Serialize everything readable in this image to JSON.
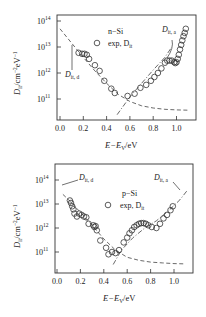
{
  "chart_data": [
    {
      "type": "scatter",
      "title": "n-Si",
      "xlabel": "E−E_V/eV",
      "ylabel": "D_it/cm^-2eV^-1",
      "xlim": [
        -0.02,
        1.12
      ],
      "ylim_log10": [
        10.5,
        14.2
      ],
      "yscale": "log",
      "xticks": [
        "0.0",
        "0.2",
        "0.4",
        "0.6",
        "0.8",
        "1.0"
      ],
      "xtick_values": [
        0.0,
        0.2,
        0.4,
        0.6,
        0.8,
        1.0
      ],
      "yticks": [
        "10^11",
        "10^12",
        "10^13",
        "10^14"
      ],
      "ytick_exponents": [
        11,
        12,
        13,
        14
      ],
      "legend": [
        {
          "label": "n−Si",
          "marker": "none"
        },
        {
          "label": "exp, D_it",
          "marker": "circle"
        }
      ],
      "annotations": [
        "D_it, d",
        "D_it, a"
      ],
      "series": [
        {
          "name": "exp, D_it",
          "marker": "circle",
          "x": [
            0.16,
            0.19,
            0.21,
            0.23,
            0.25,
            0.3,
            0.34,
            0.38,
            0.44,
            0.47,
            0.58,
            0.64,
            0.69,
            0.74,
            0.78,
            0.81,
            0.84,
            0.87,
            0.9,
            0.92,
            0.94,
            0.96,
            0.98,
            0.99,
            1.0,
            1.01,
            1.02,
            1.03,
            1.04,
            1.05,
            1.06,
            1.07,
            1.08
          ],
          "y": [
            6000000000000.0,
            5500000000000.0,
            5500000000000.0,
            5000000000000.0,
            3500000000000.0,
            2000000000000.0,
            1200000000000.0,
            500000000000.0,
            250000000000.0,
            170000000000.0,
            130000000000.0,
            160000000000.0,
            270000000000.0,
            350000000000.0,
            500000000000.0,
            700000000000.0,
            1000000000000.0,
            1500000000000.0,
            2500000000000.0,
            3000000000000.0,
            3000000000000.0,
            3000000000000.0,
            2600000000000.0,
            2400000000000.0,
            2600000000000.0,
            3500000000000.0,
            5000000000000.0,
            8000000000000.0,
            12000000000000.0,
            18000000000000.0,
            26000000000000.0,
            35000000000000.0,
            50000000000000.0
          ]
        },
        {
          "name": "D_it, d",
          "style": "dashed",
          "x": [
            0.0,
            0.1,
            0.2,
            0.3,
            0.4,
            0.5,
            0.6,
            0.7,
            0.8,
            0.9,
            1.0,
            1.1
          ],
          "y": [
            50000000000000.0,
            14000000000000.0,
            4000000000000.0,
            1200000000000.0,
            400000000000.0,
            150000000000.0,
            80000000000.0,
            55000000000.0,
            45000000000.0,
            40000000000.0,
            38000000000.0,
            37000000000.0
          ]
        },
        {
          "name": "D_it, a",
          "style": "dashdot",
          "x": [
            0.49,
            0.6,
            0.7,
            0.8,
            0.9,
            0.96
          ],
          "y": [
            25000000000.0,
            120000000000.0,
            400000000000.0,
            1300000000000.0,
            4000000000000.0,
            10000000000000.0
          ]
        }
      ]
    },
    {
      "type": "scatter",
      "title": "p-Si",
      "xlabel": "E−E_V/eV",
      "ylabel": "D_it/cm^-2eV^-1",
      "xlim": [
        -0.02,
        1.12
      ],
      "ylim_log10": [
        10.3,
        14.2
      ],
      "yscale": "log",
      "xticks": [
        "0.0",
        "0.2",
        "0.4",
        "0.6",
        "0.8",
        "1.0"
      ],
      "xtick_values": [
        0.0,
        0.2,
        0.4,
        0.6,
        0.8,
        1.0
      ],
      "yticks": [
        "10^11",
        "10^12",
        "10^13",
        "10^14"
      ],
      "ytick_exponents": [
        11,
        12,
        13,
        14
      ],
      "legend": [
        {
          "label": "p−Si",
          "marker": "none"
        },
        {
          "label": "exp, D_it",
          "marker": "circle"
        }
      ],
      "annotations": [
        "D_it, d",
        "D_it, a"
      ],
      "series": [
        {
          "name": "exp, D_it",
          "marker": "circle",
          "x": [
            0.11,
            0.12,
            0.13,
            0.14,
            0.15,
            0.17,
            0.19,
            0.21,
            0.23,
            0.25,
            0.27,
            0.31,
            0.32,
            0.33,
            0.34,
            0.37,
            0.42,
            0.44,
            0.47,
            0.5,
            0.53,
            0.57,
            0.6,
            0.62,
            0.64,
            0.66,
            0.68,
            0.7,
            0.72,
            0.74,
            0.76,
            0.78,
            0.81,
            0.85,
            0.88,
            0.91,
            0.94,
            0.97,
            0.99
          ],
          "y": [
            14000000000000.0,
            11000000000000.0,
            8000000000000.0,
            6000000000000.0,
            4000000000000.0,
            3000000000000.0,
            4000000000000.0,
            3500000000000.0,
            3000000000000.0,
            2800000000000.0,
            1500000000000.0,
            1300000000000.0,
            1100000000000.0,
            1200000000000.0,
            800000000000.0,
            300000000000.0,
            150000000000.0,
            80000000000.0,
            100000000000.0,
            90000000000.0,
            120000000000.0,
            250000000000.0,
            400000000000.0,
            600000000000.0,
            800000000000.0,
            1100000000000.0,
            1300000000000.0,
            1500000000000.0,
            1600000000000.0,
            1600000000000.0,
            1500000000000.0,
            1300000000000.0,
            1100000000000.0,
            1000000000000.0,
            1500000000000.0,
            2500000000000.0,
            3500000000000.0,
            5500000000000.0,
            8000000000000.0
          ]
        },
        {
          "name": "D_it, d",
          "style": "dashed",
          "x": [
            0.05,
            0.1,
            0.2,
            0.3,
            0.4,
            0.5,
            0.6,
            0.7,
            0.8,
            0.9,
            1.0,
            1.1
          ],
          "y": [
            25000000000000.0,
            15000000000000.0,
            4500000000000.0,
            1300000000000.0,
            350000000000.0,
            120000000000.0,
            60000000000.0,
            45000000000.0,
            38000000000.0,
            35000000000.0,
            33000000000.0,
            32000000000.0
          ]
        },
        {
          "name": "D_it, a",
          "style": "dashdot",
          "x": [
            0.48,
            0.55,
            0.65,
            0.75,
            0.85,
            0.95,
            1.05,
            1.11
          ],
          "y": [
            30000000000.0,
            120000000000.0,
            400000000000.0,
            1000000000000.0,
            2000000000000.0,
            5000000000000.0,
            15000000000000.0,
            35000000000000.0
          ]
        }
      ]
    }
  ],
  "charts": {
    "top": {
      "legend_title": "n−Si",
      "legend_series": "exp, D",
      "legend_series_sub": "it",
      "ann_d_main": "D",
      "ann_d_sub": "it, d",
      "ann_a_main": "D",
      "ann_a_sub": "it, a",
      "ylabel_main": "D",
      "ylabel_sub": "it",
      "ylabel_rest": "/cm",
      "ylabel_sup1": "−2",
      "ylabel_rest2": "eV",
      "ylabel_sup2": "−1",
      "xlabel_a": "E−E",
      "xlabel_sub": "V",
      "xlabel_b": "/eV"
    },
    "bottom": {
      "legend_title": "p−Si",
      "legend_series": "exp, D",
      "legend_series_sub": "it",
      "ann_d_main": "D",
      "ann_d_sub": "it, d",
      "ann_a_main": "D",
      "ann_a_sub": "it, a",
      "ylabel_main": "D",
      "ylabel_sub": "it",
      "ylabel_rest": "/cm",
      "ylabel_sup1": "−2",
      "ylabel_rest2": "eV",
      "ylabel_sup2": "−1",
      "xlabel_a": "E−E",
      "xlabel_sub": "V",
      "xlabel_b": "/eV"
    }
  }
}
